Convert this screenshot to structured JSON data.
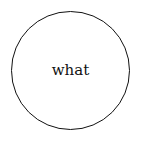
{
  "diagram": {
    "nodes": [
      {
        "shape": "circle",
        "label": "what"
      }
    ]
  }
}
